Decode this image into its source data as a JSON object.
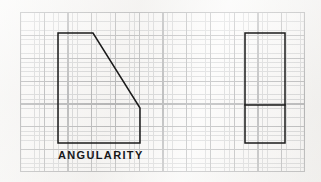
{
  "figure": {
    "title": "ANGULARITY",
    "label": "ANGULARITY",
    "medium": "graph paper",
    "line_color": "#1a1a1a",
    "grid_major_color": "#7d7f82",
    "grid_minor_color": "#b9bbbd",
    "paper_color": "#f4f3f1"
  },
  "grid": {
    "x": 20,
    "y": 12,
    "width": 285,
    "height": 160,
    "minor_cell_w": 4.75,
    "minor_cell_h": 4.571,
    "major_every": 5,
    "columns": 60,
    "rows": 35
  },
  "shapes": {
    "left_polygon": {
      "name": "angularity-part-profile",
      "description": "Part profile with angled (chamfered) upper right edge",
      "points": "58,33 93,33 140,108 140,143 58,143",
      "vertices": [
        {
          "x": 58,
          "y": 33
        },
        {
          "x": 93,
          "y": 33
        },
        {
          "x": 140,
          "y": 108
        },
        {
          "x": 140,
          "y": 143
        },
        {
          "x": 58,
          "y": 143
        }
      ],
      "stroke_width": 1.5
    },
    "right_rectangle": {
      "name": "angularity-reference-block",
      "description": "Reference block rectangle with horizontal division line",
      "x": 245,
      "y": 33,
      "width": 40,
      "height": 110,
      "stroke_width": 1.5
    },
    "right_divider": {
      "name": "block-division-line",
      "x1": 245,
      "y1": 105,
      "x2": 285,
      "y2": 105,
      "stroke_width": 1.5
    }
  }
}
